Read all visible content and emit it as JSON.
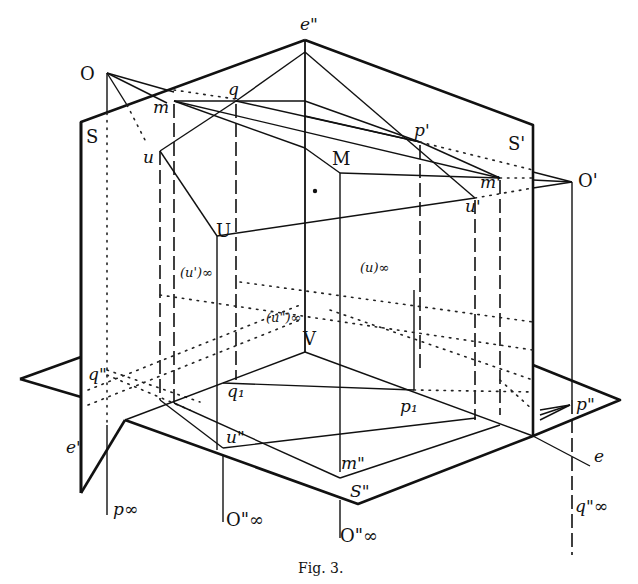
{
  "figure": {
    "caption": "Fig. 3.",
    "labels": {
      "O": "O",
      "e_dd": "e\"",
      "m": "m",
      "q": "q",
      "p_prime": "p'",
      "S": "S",
      "S_prime": "S'",
      "O_prime": "O'",
      "u": "u",
      "M": "M",
      "m_prime": "m'",
      "u_prime": "u'",
      "U": "U",
      "u_prime_inf": "(u')∞",
      "u_inf": "(u)∞",
      "u_dd_inf": "(u\")∞",
      "V": "V",
      "q_dd": "q\"",
      "q1": "q₁",
      "p1": "p₁",
      "p_dd": "p\"",
      "e_prime": "e'",
      "u_dd": "u\"",
      "m_dd": "m\"",
      "S_dd": "S\"",
      "e": "e",
      "p_inf": "p∞",
      "O_dd_inf_left": "O\"∞",
      "O_dd_inf_center": "O\"∞",
      "q_dd_inf": "q\"∞"
    }
  }
}
